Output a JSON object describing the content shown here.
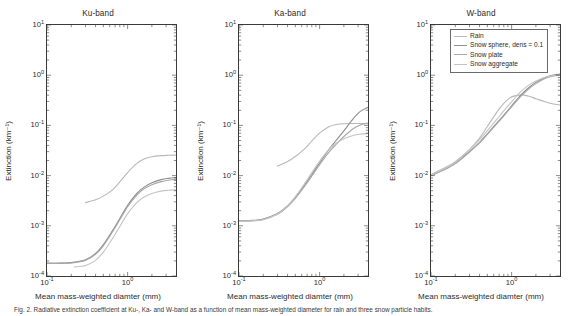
{
  "figure": {
    "caption": "Fig. 2.  Radiative extinction coefficient at Ku-, Ka- and W-band as a function of mean mass-weighted diameter for rain and three snow particle habits.",
    "xlabel": "Mean mass-weighted diamter (mm)",
    "ylabel": "Extinction (km⁻¹)",
    "legend": {
      "position": "upper-right-in-w-panel",
      "entries": [
        {
          "label": "Rain",
          "color": "#b9b9b9"
        },
        {
          "label": "Snow sphere, dens = 0.1",
          "color": "#8e8e8e"
        },
        {
          "label": "Snow plate",
          "color": "#a8a8a8"
        },
        {
          "label": "Snow aggregate",
          "color": "#c4c4c4"
        }
      ]
    },
    "axis": {
      "xlim": [
        -1,
        0.6
      ],
      "ylim": [
        -4,
        1
      ],
      "xticks": [
        {
          "exp": "-1",
          "base": "10"
        },
        {
          "exp": "0",
          "base": "10"
        }
      ],
      "yticks": [
        {
          "base": "10",
          "exp": "1"
        },
        {
          "base": "10",
          "exp": "0"
        },
        {
          "base": "10",
          "exp": "-1"
        },
        {
          "base": "10",
          "exp": "-2"
        },
        {
          "base": "10",
          "exp": "-3"
        },
        {
          "base": "10",
          "exp": "-4"
        }
      ],
      "grid": false,
      "xscale": "log",
      "yscale": "log"
    }
  },
  "chart_data": [
    {
      "type": "line",
      "title": "Ku-band",
      "xlabel": "Mean mass-weighted diamter (mm)",
      "ylabel": "Extinction (km⁻¹)",
      "xscale": "log",
      "yscale": "log",
      "xlim": [
        0.1,
        4.0
      ],
      "ylim": [
        0.0001,
        10
      ],
      "series": [
        {
          "name": "Rain",
          "color": "#b9b9b9",
          "x": [
            0.3,
            0.4,
            0.5,
            0.65,
            0.8,
            1.0,
            1.3,
            1.6,
            2.0,
            2.6,
            3.2,
            4.0
          ],
          "y": [
            0.0029,
            0.0033,
            0.0039,
            0.0052,
            0.0075,
            0.0115,
            0.0175,
            0.0215,
            0.0238,
            0.025,
            0.0254,
            0.0256
          ]
        },
        {
          "name": "Snow sphere, dens = 0.1",
          "color": "#8e8e8e",
          "x": [
            0.1,
            0.15,
            0.2,
            0.3,
            0.4,
            0.5,
            0.65,
            0.8,
            1.0,
            1.3,
            1.6,
            2.0,
            2.6,
            3.2,
            4.0
          ],
          "y": [
            0.00018,
            0.00018,
            0.000185,
            0.00021,
            0.00028,
            0.00042,
            0.0008,
            0.0014,
            0.00255,
            0.0044,
            0.0059,
            0.0072,
            0.0083,
            0.0088,
            0.0091
          ]
        },
        {
          "name": "Snow plate",
          "color": "#a8a8a8",
          "x": [
            0.1,
            0.15,
            0.2,
            0.3,
            0.4,
            0.5,
            0.65,
            0.8,
            1.0,
            1.3,
            1.6,
            2.0,
            2.6,
            3.2,
            4.0
          ],
          "y": [
            0.00018,
            0.00018,
            0.000182,
            0.000205,
            0.00027,
            0.0004,
            0.00076,
            0.00132,
            0.0024,
            0.0041,
            0.00545,
            0.0066,
            0.0076,
            0.0081,
            0.0084
          ]
        },
        {
          "name": "Snow aggregate",
          "color": "#c4c4c4",
          "x": [
            0.22,
            0.3,
            0.4,
            0.5,
            0.65,
            0.8,
            1.0,
            1.3,
            1.6,
            2.0,
            2.6,
            3.2,
            4.0
          ],
          "y": [
            0.000152,
            0.000162,
            0.000205,
            0.0003,
            0.00056,
            0.00097,
            0.00175,
            0.0029,
            0.00375,
            0.0044,
            0.0049,
            0.0051,
            0.0052
          ]
        }
      ]
    },
    {
      "type": "line",
      "title": "Ka-band",
      "xlabel": "Mean mass-weighted diamter (mm)",
      "ylabel": "Extinction (km⁻¹)",
      "xscale": "log",
      "yscale": "log",
      "xlim": [
        0.1,
        4.0
      ],
      "ylim": [
        0.0001,
        10
      ],
      "series": [
        {
          "name": "Rain",
          "color": "#b9b9b9",
          "x": [
            0.3,
            0.4,
            0.5,
            0.65,
            0.8,
            1.0,
            1.3,
            1.6,
            2.0,
            2.6,
            3.2,
            4.0
          ],
          "y": [
            0.0155,
            0.019,
            0.024,
            0.034,
            0.049,
            0.07,
            0.094,
            0.104,
            0.108,
            0.109,
            0.109,
            0.1085
          ]
        },
        {
          "name": "Snow sphere, dens = 0.1",
          "color": "#8e8e8e",
          "x": [
            0.1,
            0.15,
            0.2,
            0.3,
            0.4,
            0.5,
            0.65,
            0.8,
            1.0,
            1.3,
            1.6,
            2.0,
            2.6,
            3.2,
            4.0
          ],
          "y": [
            0.00125,
            0.00128,
            0.00136,
            0.00175,
            0.0025,
            0.0037,
            0.0065,
            0.0105,
            0.018,
            0.033,
            0.05,
            0.078,
            0.135,
            0.19,
            0.23
          ]
        },
        {
          "name": "Snow plate",
          "color": "#a8a8a8",
          "x": [
            0.1,
            0.15,
            0.2,
            0.3,
            0.4,
            0.5,
            0.65,
            0.8,
            1.0,
            1.3,
            1.6,
            2.0,
            2.6,
            3.2,
            4.0
          ],
          "y": [
            0.00125,
            0.00127,
            0.00134,
            0.0017,
            0.0024,
            0.0035,
            0.0061,
            0.0098,
            0.0165,
            0.029,
            0.042,
            0.06,
            0.086,
            0.102,
            0.112
          ]
        },
        {
          "name": "Snow aggregate",
          "color": "#c4c4c4",
          "x": [
            0.1,
            0.15,
            0.2,
            0.3,
            0.4,
            0.5,
            0.65,
            0.8,
            1.0,
            1.3,
            1.6,
            2.0,
            2.6,
            3.2,
            4.0
          ],
          "y": [
            0.00122,
            0.00125,
            0.00132,
            0.00172,
            0.0025,
            0.0038,
            0.0069,
            0.0115,
            0.0195,
            0.033,
            0.044,
            0.054,
            0.063,
            0.067,
            0.069
          ]
        }
      ]
    },
    {
      "type": "line",
      "title": "W-band",
      "xlabel": "Mean mass-weighted diamter (mm)",
      "ylabel": "Extinction (km⁻¹)",
      "xscale": "log",
      "yscale": "log",
      "xlim": [
        0.1,
        4.0
      ],
      "ylim": [
        0.0001,
        10
      ],
      "series": [
        {
          "name": "Rain",
          "color": "#b9b9b9",
          "x": [
            0.1,
            0.15,
            0.2,
            0.3,
            0.4,
            0.5,
            0.65,
            0.8,
            1.0,
            1.3,
            1.6,
            2.0,
            2.6,
            3.2,
            4.0
          ],
          "y": [
            0.0105,
            0.0145,
            0.019,
            0.033,
            0.056,
            0.095,
            0.18,
            0.275,
            0.37,
            0.405,
            0.385,
            0.34,
            0.295,
            0.27,
            0.255
          ]
        },
        {
          "name": "Snow sphere, dens = 0.1",
          "color": "#8e8e8e",
          "x": [
            0.1,
            0.15,
            0.2,
            0.3,
            0.4,
            0.5,
            0.65,
            0.8,
            1.0,
            1.3,
            1.6,
            2.0,
            2.6,
            3.2,
            4.0
          ],
          "y": [
            0.01,
            0.0135,
            0.0175,
            0.03,
            0.046,
            0.068,
            0.11,
            0.16,
            0.245,
            0.4,
            0.55,
            0.72,
            0.9,
            1.0,
            1.05
          ]
        },
        {
          "name": "Snow plate",
          "color": "#a8a8a8",
          "x": [
            0.1,
            0.15,
            0.2,
            0.3,
            0.4,
            0.5,
            0.65,
            0.8,
            1.0,
            1.3,
            1.6,
            2.0,
            2.6,
            3.2,
            4.0
          ],
          "y": [
            0.01,
            0.0134,
            0.0173,
            0.0295,
            0.045,
            0.066,
            0.106,
            0.155,
            0.235,
            0.38,
            0.52,
            0.68,
            0.86,
            0.96,
            1.01
          ]
        },
        {
          "name": "Snow aggregate",
          "color": "#c4c4c4",
          "x": [
            0.1,
            0.15,
            0.2,
            0.3,
            0.4,
            0.5,
            0.65,
            0.8,
            1.0,
            1.3,
            1.6,
            2.0,
            2.6,
            3.2,
            4.0
          ],
          "y": [
            0.0102,
            0.014,
            0.0185,
            0.033,
            0.052,
            0.079,
            0.13,
            0.195,
            0.295,
            0.47,
            0.62,
            0.77,
            0.91,
            0.97,
            0.99
          ]
        }
      ]
    }
  ]
}
